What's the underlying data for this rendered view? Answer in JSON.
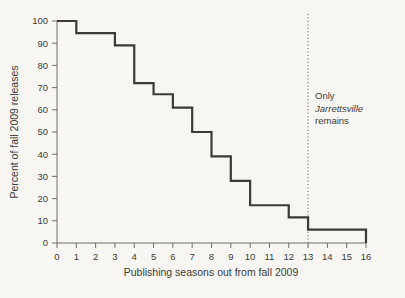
{
  "chart_data": {
    "type": "line",
    "subtype": "step-function",
    "title": "",
    "xlabel": "Publishing seasons out from fall 2009",
    "ylabel": "Percent of fall 2009 releases",
    "xlim": [
      0,
      16
    ],
    "ylim": [
      0,
      100
    ],
    "xticks": [
      "0",
      "1",
      "2",
      "3",
      "4",
      "5",
      "6",
      "7",
      "8",
      "9",
      "10",
      "11",
      "12",
      "13",
      "14",
      "15",
      "16"
    ],
    "yticks": [
      "0",
      "10",
      "20",
      "30",
      "40",
      "50",
      "60",
      "70",
      "80",
      "90",
      "100"
    ],
    "grid": false,
    "legend": false,
    "x": [
      0,
      1,
      2,
      3,
      4,
      5,
      6,
      7,
      8,
      9,
      10,
      11,
      12,
      13,
      14,
      15,
      16
    ],
    "values": [
      100,
      94.5,
      94.5,
      89,
      72,
      67,
      61,
      50,
      39,
      28,
      17,
      17,
      11.5,
      6,
      6,
      6,
      6
    ],
    "series": [
      {
        "name": "Percent of fall 2009 releases still in print",
        "values": [
          100,
          94.5,
          94.5,
          89,
          72,
          67,
          61,
          50,
          39,
          28,
          17,
          17,
          11.5,
          6,
          6,
          6,
          6
        ]
      }
    ],
    "line_color": "#3a3a36",
    "line_width": 2.2,
    "annotations": [
      {
        "name": "jarrettsville-note",
        "x": 13,
        "lines": [
          "Only",
          "Jarrettsville",
          "remains"
        ],
        "italic_line_index": 1,
        "marker": "dotted-vertical-line",
        "marker_x": 13,
        "marker_color": "#6e6e66"
      }
    ]
  },
  "colors": {
    "background": "#f7f6f2",
    "ink": "#3a3a36",
    "axis": "#6e6e66",
    "dotted": "#7a7a72"
  }
}
